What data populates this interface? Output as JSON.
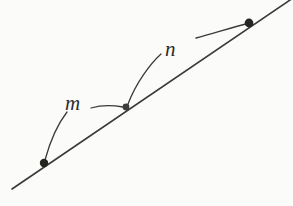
{
  "figure": {
    "kind": "geometry-line-diagram",
    "background_color": "#fbfbf9",
    "stroke_color": "#3a3a38",
    "dot_color": "#262522",
    "labels": [
      {
        "id": "m",
        "text": "m",
        "x": 65,
        "y": 93
      },
      {
        "id": "n",
        "text": "n",
        "x": 165,
        "y": 39
      }
    ],
    "main_line": {
      "name": "main-line",
      "from": {
        "x": 12,
        "y": 189
      },
      "to": {
        "x": 293,
        "y": -2
      },
      "stroke_width": 1.6
    },
    "points": [
      {
        "id": "lower-left",
        "x": 44,
        "y": 163,
        "radius": 4.2,
        "label": "m"
      },
      {
        "id": "middle",
        "x": 126,
        "y": 107,
        "radius": 3.4,
        "label": "m-and-n"
      },
      {
        "id": "upper-right",
        "x": 249,
        "y": 23,
        "radius": 4.4,
        "label": "n"
      }
    ],
    "leaders": [
      {
        "id": "m-leader-to-lower-left",
        "path": "M 67 112 C 60 121, 51 138, 45 160",
        "stroke_width": 1.3
      },
      {
        "id": "m-leader-to-middle",
        "path": "M 91 108 C 101 105, 112 105, 123 107",
        "stroke_width": 1.3
      },
      {
        "id": "n-leader-to-middle",
        "path": "M 161 54 C 150 64, 136 83, 128 104",
        "stroke_width": 1.3
      },
      {
        "id": "n-leader-to-upper-right",
        "path": "M 196 38 C 212 34, 233 27, 246 24",
        "stroke_width": 1.3
      }
    ]
  }
}
